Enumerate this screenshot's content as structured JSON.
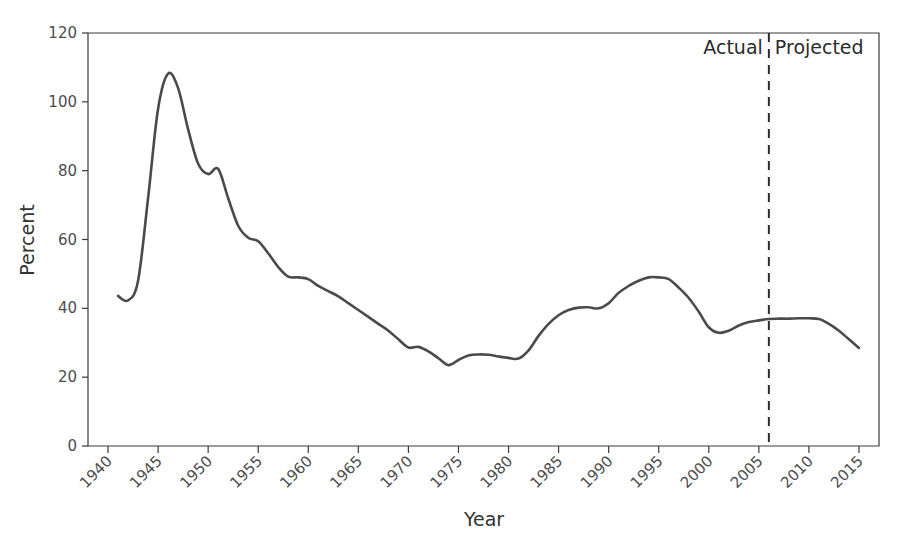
{
  "chart_data": {
    "type": "line",
    "title": "",
    "xlabel": "Year",
    "ylabel": "Percent",
    "xlim": [
      1938,
      2017
    ],
    "ylim": [
      0,
      120
    ],
    "grid": false,
    "legend": null,
    "yticks": [
      0,
      20,
      40,
      60,
      80,
      100,
      120
    ],
    "xticks": [
      1940,
      1945,
      1950,
      1955,
      1960,
      1965,
      1970,
      1975,
      1980,
      1985,
      1990,
      1995,
      2000,
      2005,
      2010,
      2015
    ],
    "xtick_labels": [
      "1940",
      "1945",
      "1950",
      "1955",
      "1960",
      "1965",
      "1970",
      "1975",
      "1980",
      "1985",
      "1990",
      "1995",
      "2000",
      "2005",
      "2010",
      "2015"
    ],
    "ytick_labels": [
      "0",
      "20",
      "40",
      "60",
      "80",
      "100",
      "120"
    ],
    "xtick_rotation": 45,
    "line_color": "#4a4a4a",
    "series": [
      {
        "name": "Debt held by the public as percent of GDP",
        "x": [
          1941,
          1942,
          1943,
          1944,
          1945,
          1946,
          1947,
          1948,
          1949,
          1950,
          1951,
          1952,
          1953,
          1954,
          1955,
          1956,
          1957,
          1958,
          1959,
          1960,
          1961,
          1962,
          1963,
          1964,
          1965,
          1966,
          1967,
          1968,
          1969,
          1970,
          1971,
          1972,
          1973,
          1974,
          1975,
          1976,
          1977,
          1978,
          1979,
          1980,
          1981,
          1982,
          1983,
          1984,
          1985,
          1986,
          1987,
          1988,
          1989,
          1990,
          1991,
          1992,
          1993,
          1994,
          1995,
          1996,
          1997,
          1998,
          1999,
          2000,
          2001,
          2002,
          2003,
          2004,
          2005,
          2006,
          2007,
          2008,
          2009,
          2010,
          2011,
          2012,
          2013,
          2014,
          2015
        ],
        "y": [
          43.6,
          42.3,
          48.0,
          72.0,
          98.0,
          108.2,
          104.0,
          92.0,
          82.0,
          79.0,
          80.5,
          72.0,
          64.0,
          60.5,
          59.5,
          56.0,
          52.0,
          49.2,
          49.0,
          48.5,
          46.5,
          45.0,
          43.5,
          41.5,
          39.5,
          37.5,
          35.5,
          33.5,
          31.0,
          28.6,
          28.8,
          27.5,
          25.5,
          23.5,
          25.0,
          26.3,
          26.6,
          26.5,
          26.0,
          25.6,
          25.4,
          27.8,
          32.0,
          35.5,
          38.0,
          39.5,
          40.2,
          40.3,
          40.0,
          41.5,
          44.5,
          46.5,
          48.0,
          49.0,
          49.0,
          48.5,
          46.0,
          43.0,
          39.0,
          34.5,
          32.9,
          33.5,
          35.0,
          36.0,
          36.5,
          36.9,
          37.0,
          37.0,
          37.1,
          37.1,
          36.9,
          35.5,
          33.5,
          31.0,
          28.5
        ],
        "color": "#4a4a4a"
      }
    ],
    "annotations": [
      {
        "name": "divider",
        "type": "vline",
        "x": 2006.0,
        "style": "dashed",
        "color": "#2b2b2b"
      },
      {
        "name": "actual-label",
        "type": "text",
        "text": "Actual",
        "x": 2005.4,
        "y": 114.0,
        "anchor": "end"
      },
      {
        "name": "projected-label",
        "type": "text",
        "text": "Projected",
        "x": 2006.6,
        "y": 114.0,
        "anchor": "start"
      }
    ]
  },
  "labels": {
    "x_axis_title": "Year",
    "y_axis_title": "Percent",
    "actual": "Actual",
    "projected": "Projected"
  }
}
